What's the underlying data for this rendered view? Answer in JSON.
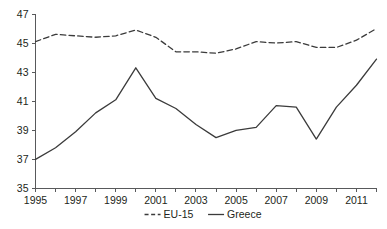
{
  "chart_data": {
    "type": "line",
    "title": "",
    "subtitle": "",
    "xlabel": "",
    "ylabel": "",
    "x": [
      1995,
      1996,
      1997,
      1998,
      1999,
      2000,
      2001,
      2002,
      2003,
      2004,
      2005,
      2006,
      2007,
      2008,
      2009,
      2010,
      2011,
      2012
    ],
    "xlim": [
      1995,
      2012
    ],
    "ylim": [
      35,
      47
    ],
    "yticks": [
      35,
      37,
      39,
      41,
      43,
      45,
      47
    ],
    "ytick_labels": [
      "35",
      "37",
      "39",
      "41",
      "43",
      "45",
      "47"
    ],
    "xticks": [
      1995,
      1996,
      1997,
      1998,
      1999,
      2000,
      2001,
      2002,
      2003,
      2004,
      2005,
      2006,
      2007,
      2008,
      2009,
      2010,
      2011,
      2012
    ],
    "xtick_labels_shown": [
      "1995",
      "1997",
      "1999",
      "2001",
      "2003",
      "2005",
      "2007",
      "2009",
      "2011"
    ],
    "xtick_label_years": [
      1995,
      1997,
      1999,
      2001,
      2003,
      2005,
      2007,
      2009,
      2011
    ],
    "grid": false,
    "legend_position": "bottom-center",
    "series": [
      {
        "name": "EU-15",
        "style": "dashed",
        "color": "#3b3b3b",
        "values": [
          45.1,
          45.6,
          45.5,
          45.4,
          45.5,
          45.9,
          45.4,
          44.4,
          44.4,
          44.3,
          44.6,
          45.1,
          45.0,
          45.1,
          44.7,
          44.7,
          45.2,
          46.0
        ]
      },
      {
        "name": "Greece",
        "style": "solid",
        "color": "#3b3b3b",
        "values": [
          37.0,
          37.8,
          38.9,
          40.2,
          41.1,
          43.3,
          41.2,
          40.5,
          39.4,
          38.5,
          39.0,
          39.2,
          40.7,
          40.6,
          38.4,
          40.6,
          42.1,
          43.9
        ]
      }
    ],
    "legend": [
      {
        "label": "EU-15",
        "style": "dashed"
      },
      {
        "label": "Greece",
        "style": "solid"
      }
    ]
  },
  "colors": {
    "line": "#3b3b3b",
    "axis": "#58595b",
    "text": "#231f20",
    "background": "#ffffff"
  }
}
